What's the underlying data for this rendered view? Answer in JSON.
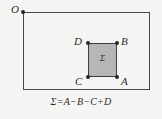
{
  "figure": {
    "background_color": "#f6f5f3",
    "caption": "Σ=A−B−C+D"
  },
  "outer_region": {
    "name": "outer-rectangle",
    "stroke_color": "#4a4a4a",
    "origin_label": "O"
  },
  "inner_region": {
    "name": "shaded-rectangle",
    "fill_color": "#b6b6b6",
    "stroke_color": "#3f3f3f",
    "inner_label": "Σ"
  },
  "points": {
    "o": "O",
    "a": "A",
    "b": "B",
    "c": "C",
    "d": "D"
  }
}
